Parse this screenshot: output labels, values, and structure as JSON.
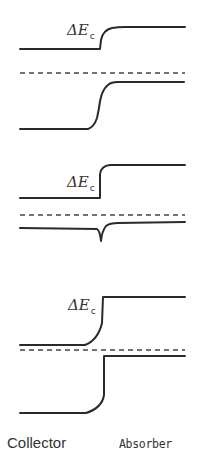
{
  "figure": {
    "panels": [
      {
        "id": "panel-1",
        "label": "ΔE",
        "label_sub": "c",
        "conduction_band": "step up at interface",
        "fermi_level": "dashed",
        "valence_band": "graded rise at interface"
      },
      {
        "id": "panel-2",
        "label": "ΔE",
        "label_sub": "c",
        "conduction_band": "abrupt step up at interface",
        "fermi_level": "dashed",
        "valence_band": "notch spike down at interface"
      },
      {
        "id": "panel-3",
        "label": "ΔE",
        "label_sub": "c",
        "conduction_band": "curved rise then abrupt step",
        "fermi_level": "dashed",
        "valence_band": "deep step down on collector side"
      }
    ],
    "regions": {
      "left": "Collector",
      "right": "Absorber"
    },
    "colors": {
      "line": "#2a2a2a",
      "background": "#ffffff"
    }
  }
}
